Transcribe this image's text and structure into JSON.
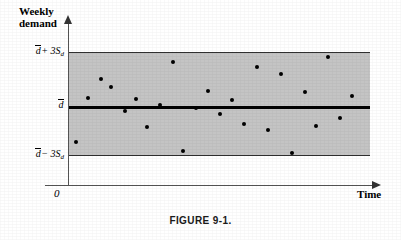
{
  "figure": {
    "caption": "FIGURE 9-1.",
    "origin_label": "0"
  },
  "axes": {
    "y_title_line1": "Weekly",
    "y_title_line2": "demand",
    "x_title": "Time"
  },
  "labels": {
    "ucl_prefix": "d",
    "ucl_suffix": "+ 3S",
    "ucl_sub": "d",
    "center_main": "d",
    "lcl_prefix": "d",
    "lcl_suffix": "− 3S",
    "lcl_sub": "d"
  },
  "colors": {
    "band_fill": "#c4c4c4",
    "center_line": "#000000",
    "limit_line": "#303030",
    "axis": "#555555",
    "dot": "#000000",
    "background": "#ffffff"
  },
  "chart_data": {
    "type": "scatter",
    "title": "FIGURE 9-1.",
    "xlabel": "Time",
    "ylabel": "Weekly demand",
    "grid": false,
    "legend": null,
    "ylim": [
      -3,
      3
    ],
    "ytick_values": [
      3,
      0,
      -3
    ],
    "ytick_labels": [
      "d̄ + 3S_d",
      "d̄",
      "d̄ − 3S_d"
    ],
    "control_limits": {
      "upper": 3,
      "center": 0,
      "lower": -3,
      "units": "standard deviations of demand (S_d)"
    },
    "band_shaded": true,
    "x": [
      1,
      2,
      3,
      4,
      5,
      6,
      7,
      8,
      9,
      10,
      11,
      12,
      13,
      14,
      15,
      16,
      17,
      18,
      19,
      20,
      21,
      22,
      23,
      24
    ],
    "y": [
      -1.55,
      0.55,
      1.35,
      1.1,
      0.0,
      0.5,
      -0.75,
      0.35,
      2.4,
      -1.25,
      0.25,
      0.95,
      -0.3,
      0.75,
      -0.5,
      2.15,
      -0.65,
      1.85,
      -1.35,
      0.9,
      -0.45,
      2.6,
      -0.2,
      0.55
    ],
    "points": [
      {
        "x": 1,
        "y": -1.55,
        "px": 76,
        "py": 142
      },
      {
        "x": 2,
        "y": 0.55,
        "px": 88,
        "py": 98
      },
      {
        "x": 3,
        "y": 1.35,
        "px": 101,
        "py": 79
      },
      {
        "x": 4,
        "y": 1.1,
        "px": 111,
        "py": 87
      },
      {
        "x": 5,
        "y": 0.0,
        "px": 125,
        "py": 111
      },
      {
        "x": 6,
        "y": 0.5,
        "px": 136,
        "py": 99
      },
      {
        "x": 7,
        "y": -0.75,
        "px": 147,
        "py": 127
      },
      {
        "x": 8,
        "y": 0.35,
        "px": 160,
        "py": 105
      },
      {
        "x": 9,
        "y": 2.4,
        "px": 173,
        "py": 62
      },
      {
        "x": 10,
        "y": -1.25,
        "px": 183,
        "py": 151
      },
      {
        "x": 11,
        "y": 0.25,
        "px": 196,
        "py": 108
      },
      {
        "x": 12,
        "y": 0.95,
        "px": 208,
        "py": 91
      },
      {
        "x": 13,
        "y": -0.3,
        "px": 220,
        "py": 114
      },
      {
        "x": 14,
        "y": 0.75,
        "px": 232,
        "py": 100
      },
      {
        "x": 15,
        "y": -0.5,
        "px": 244,
        "py": 124
      },
      {
        "x": 16,
        "y": 2.15,
        "px": 257,
        "py": 67
      },
      {
        "x": 17,
        "y": -0.65,
        "px": 268,
        "py": 130
      },
      {
        "x": 18,
        "y": 1.85,
        "px": 281,
        "py": 74
      },
      {
        "x": 19,
        "y": -1.35,
        "px": 292,
        "py": 153
      },
      {
        "x": 20,
        "y": 0.9,
        "px": 305,
        "py": 92
      },
      {
        "x": 21,
        "y": -0.45,
        "px": 316,
        "py": 126
      },
      {
        "x": 22,
        "y": 2.6,
        "px": 328,
        "py": 57
      },
      {
        "x": 23,
        "y": -0.2,
        "px": 340,
        "py": 118
      },
      {
        "x": 24,
        "y": 0.55,
        "px": 352,
        "py": 96
      }
    ]
  }
}
